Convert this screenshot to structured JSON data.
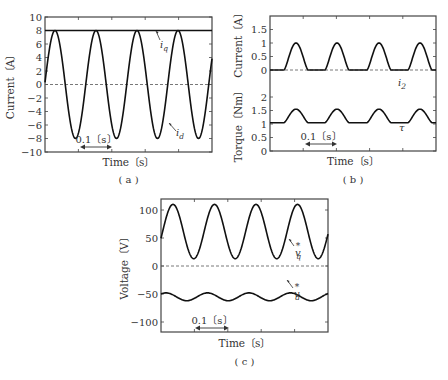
{
  "chart_data": [
    {
      "panel": "a",
      "type": "line",
      "caption": "( a )",
      "xlabel": "Time〔s〕",
      "ylabel": "Current〔A〕",
      "ylim": [
        -10,
        10
      ],
      "yticks": [
        "10",
        "8",
        "6",
        "4",
        "2",
        "0",
        "-2",
        "-4",
        "-6",
        "-8",
        "-10"
      ],
      "time_scale_annotation": "0.1〔s〕",
      "series": [
        {
          "name": "i_q",
          "label": "i",
          "sub": "q",
          "description": "constant",
          "value": 8
        },
        {
          "name": "i_d",
          "label": "i",
          "sub": "d",
          "description": "sinusoid",
          "amplitude": 8,
          "offset": 0,
          "cycles": 4
        }
      ],
      "reference_line": {
        "y": 0,
        "style": "dashed"
      }
    },
    {
      "panel": "b",
      "type": "line",
      "caption": "( b )",
      "xlabel": "Time〔s〕",
      "subplots": [
        {
          "ylabel": "Current〔A〕",
          "ylim": [
            0,
            2
          ],
          "yticks": [
            "1.5",
            "1",
            "0.5",
            "0"
          ],
          "series": [
            {
              "name": "i_2",
              "label": "i",
              "sub": "2",
              "description": "periodic half-wave pulses",
              "peak": 1,
              "base": 0,
              "pulses": 4
            }
          ]
        },
        {
          "ylabel": "Torque〔Nm〕",
          "ylim": [
            0,
            2.5
          ],
          "yticks": [
            "2",
            "1.5",
            "1",
            "0.5",
            "0"
          ],
          "series": [
            {
              "name": "tau",
              "label": "τ",
              "description": "periodic bumps",
              "base": 1.05,
              "peak": 1.55,
              "pulses": 4
            }
          ]
        }
      ],
      "time_scale_annotation": "0.1〔s〕"
    },
    {
      "panel": "c",
      "type": "line",
      "caption": "( c )",
      "xlabel": "Time〔s〕",
      "ylabel": "Voltage〔V〕",
      "ylim": [
        -120,
        120
      ],
      "yticks": [
        "100",
        "50",
        "0",
        "-50",
        "-100"
      ],
      "time_scale_annotation": "0.1〔s〕",
      "series": [
        {
          "name": "v_q*",
          "label": "v",
          "sub": "q",
          "sup": "*",
          "description": "sinusoid",
          "max": 110,
          "min": 13,
          "cycles": 4
        },
        {
          "name": "v_d*",
          "label": "v",
          "sub": "d",
          "sup": "*",
          "description": "small sinusoid",
          "max": -48,
          "min": -62,
          "cycles": 4
        }
      ],
      "reference_line": {
        "y": 0,
        "style": "dashed"
      }
    }
  ]
}
